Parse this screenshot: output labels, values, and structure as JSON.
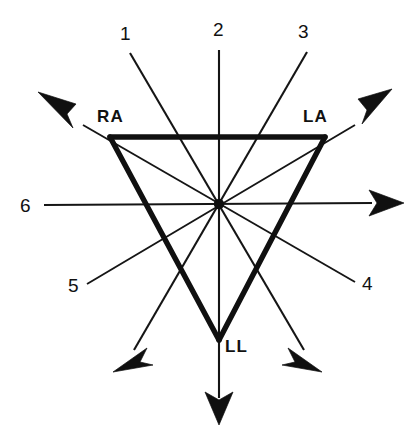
{
  "figure": {
    "background_color": "#ffffff",
    "ink_color": "#101010"
  },
  "vertices": [
    {
      "id": "RA",
      "label": "RA",
      "name": "right-arm",
      "x": 110,
      "y": 137,
      "label_x": 97,
      "label_y": 108
    },
    {
      "id": "LA",
      "label": "LA",
      "name": "left-arm",
      "x": 325,
      "y": 137,
      "label_x": 303,
      "label_y": 108
    },
    {
      "id": "LL",
      "label": "LL",
      "name": "left-leg",
      "x": 219,
      "y": 340,
      "label_x": 225,
      "label_y": 338
    }
  ],
  "center": {
    "label": "",
    "x": 219,
    "y": 204
  },
  "leads": [
    {
      "id": "1",
      "label": "1",
      "label_x": 120,
      "label_y": 24,
      "tick_from": {
        "x": 130,
        "y": 53
      },
      "tick_to": {
        "x": 219,
        "y": 204
      },
      "arrow_at": {
        "x": 325,
        "y": 380
      },
      "arrow_angle_deg": 59.5,
      "tail_x": 304,
      "tail_y": 350
    },
    {
      "id": "2",
      "label": "2",
      "label_x": 213,
      "label_y": 20,
      "tick_from": {
        "x": 219,
        "y": 50
      },
      "tick_to": {
        "x": 219,
        "y": 204
      },
      "arrow_at": {
        "x": 219,
        "y": 425
      },
      "arrow_angle_deg": 90,
      "tail_x": 219,
      "tail_y": 398
    },
    {
      "id": "3",
      "label": "3",
      "label_x": 298,
      "label_y": 22,
      "tick_from": {
        "x": 307,
        "y": 52
      },
      "tick_to": {
        "x": 219,
        "y": 204
      },
      "arrow_at": {
        "x": 113,
        "y": 380
      },
      "arrow_angle_deg": 120.5,
      "tail_x": 134,
      "tail_y": 350
    },
    {
      "id": "4",
      "label": "4",
      "label_x": 362,
      "label_y": 274,
      "tick_from": {
        "x": 355,
        "y": 282
      },
      "tick_to": {
        "x": 219,
        "y": 204
      },
      "arrow_at": {
        "x": 54,
        "y": 109
      },
      "arrow_angle_deg": 210,
      "tail_x": 83,
      "tail_y": 125
    },
    {
      "id": "5",
      "label": "5",
      "label_x": 68,
      "label_y": 276,
      "tick_from": {
        "x": 87,
        "y": 284
      },
      "tick_to": {
        "x": 219,
        "y": 204
      },
      "arrow_at": {
        "x": 384,
        "y": 109
      },
      "arrow_angle_deg": -30,
      "tail_x": 355,
      "tail_y": 125
    },
    {
      "id": "6",
      "label": "6",
      "label_x": 20,
      "label_y": 196,
      "tick_from": {
        "x": 44,
        "y": 205
      },
      "tick_to": {
        "x": 219,
        "y": 204
      },
      "arrow_at": {
        "x": 404,
        "y": 203
      },
      "arrow_angle_deg": 0,
      "tail_x": 372,
      "tail_y": 203
    }
  ],
  "triangle_sides": [
    {
      "name": "side-RA-LA",
      "from": "RA",
      "to": "LA"
    },
    {
      "name": "side-LA-LL",
      "from": "LA",
      "to": "LL"
    },
    {
      "name": "side-LL-RA",
      "from": "LL",
      "to": "RA"
    }
  ]
}
